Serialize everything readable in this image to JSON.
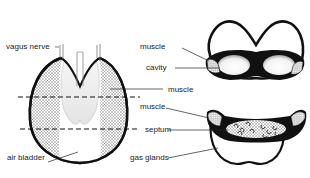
{
  "diagram": {
    "type": "anatomical",
    "labels": {
      "vagus_nerve": "vagus nerve",
      "air_bladder": "air bladder",
      "muscle_top": "muscle",
      "cavity": "cavity",
      "muscle_mid": "muscle",
      "muscle_bottom": "muscle",
      "septum": "septum",
      "gas_glands": "gas glands"
    },
    "colors": {
      "outline": "#111111",
      "stipple": "#9a9a9a",
      "background": "#ffffff",
      "text": "#222222"
    }
  }
}
